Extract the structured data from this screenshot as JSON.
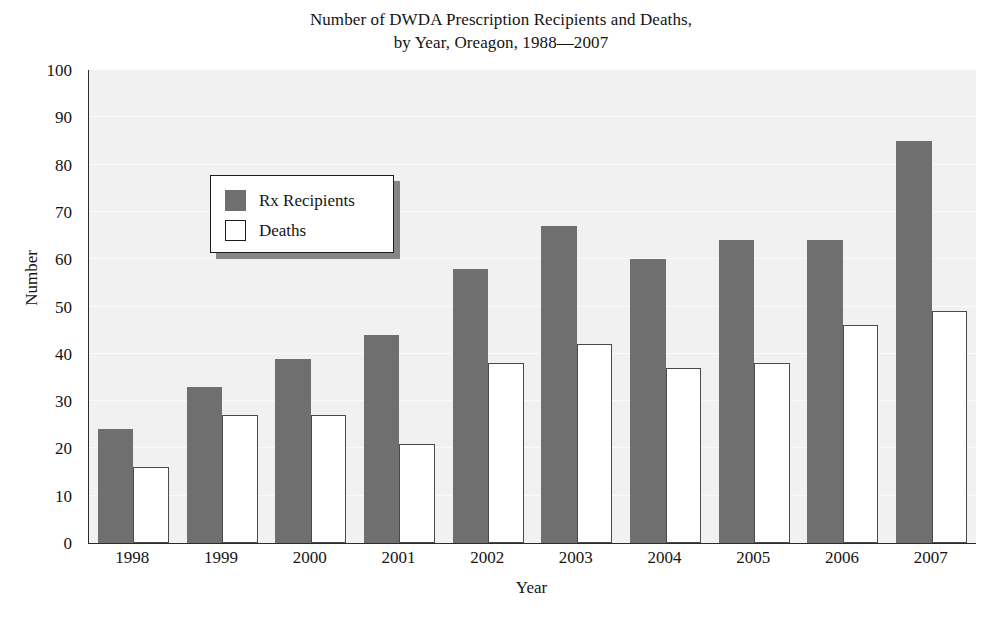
{
  "chart_data": {
    "type": "bar",
    "title": "Number of DWDA Prescription Recipients and Deaths,\nby Year, Oreagon, 1988—2007",
    "title_lines": [
      "Number of DWDA Prescription Recipients and Deaths,",
      "by Year, Oreagon, 1988—2007"
    ],
    "xlabel": "Year",
    "ylabel": "Number",
    "ylim": [
      0,
      100
    ],
    "ytick_step": 10,
    "yticks": [
      0,
      10,
      20,
      30,
      40,
      50,
      60,
      70,
      80,
      90,
      100
    ],
    "ytick_labels": [
      "0",
      "10",
      "20",
      "30",
      "40",
      "50",
      "60",
      "70",
      "80",
      "90",
      "100"
    ],
    "categories": [
      "1998",
      "1999",
      "2000",
      "2001",
      "2002",
      "2003",
      "2004",
      "2005",
      "2006",
      "2007"
    ],
    "series": [
      {
        "name": "Rx Recipients",
        "color": "#6f6f6f",
        "border": "none",
        "values": [
          24,
          33,
          39,
          44,
          58,
          67,
          60,
          64,
          64,
          85
        ]
      },
      {
        "name": "Deaths",
        "color": "#ffffff",
        "border": "#4a4a4a",
        "values": [
          16,
          27,
          27,
          21,
          38,
          42,
          37,
          38,
          46,
          49
        ]
      }
    ],
    "grid": true,
    "grid_axis": "y",
    "legend_position": "upper-left",
    "plot_background": "#f1f1f1",
    "axis_color": "#2b2b2b"
  },
  "legend": {
    "entries": [
      {
        "label": "Rx Recipients",
        "swatch": "filled-gray-square"
      },
      {
        "label": "Deaths",
        "swatch": "outlined-white-square"
      }
    ]
  }
}
